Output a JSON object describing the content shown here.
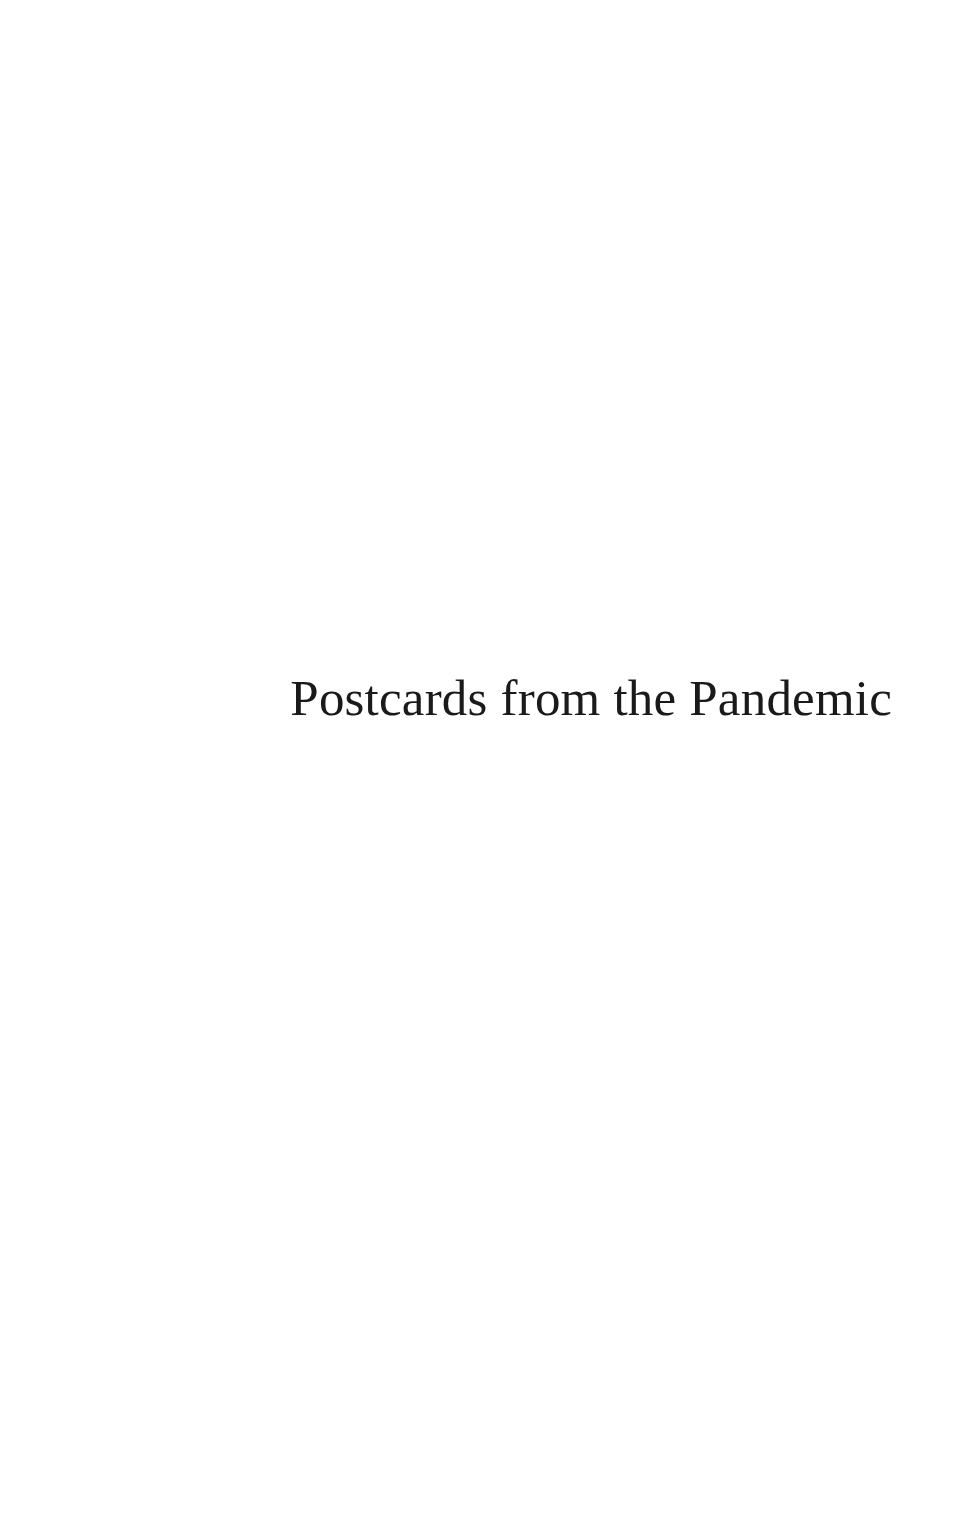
{
  "page": {
    "half_title": "Postcards from the Pandemic"
  }
}
